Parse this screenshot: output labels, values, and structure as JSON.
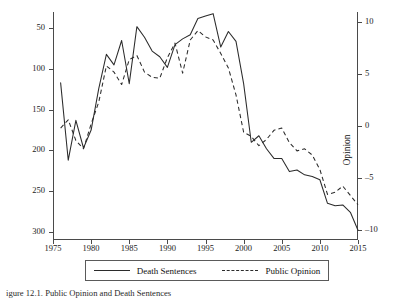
{
  "chart_data": {
    "type": "line",
    "title": "",
    "xlabel": "",
    "x": [
      1976,
      1977,
      1978,
      1979,
      1980,
      1981,
      1982,
      1983,
      1984,
      1985,
      1986,
      1987,
      1988,
      1989,
      1990,
      1991,
      1992,
      1993,
      1994,
      1995,
      1996,
      1997,
      1998,
      1999,
      2000,
      2001,
      2002,
      2003,
      2004,
      2005,
      2006,
      2007,
      2008,
      2009,
      2010,
      2011,
      2012,
      2013,
      2014,
      2015
    ],
    "xlim": [
      1975,
      2015
    ],
    "xticks": [
      1975,
      1980,
      1985,
      1990,
      1995,
      2000,
      2005,
      2010,
      2015
    ],
    "grid": false,
    "legend_position": "below-axis",
    "series": [
      {
        "name": "Death Sentences",
        "style": "solid",
        "axis": "left",
        "ylabel": "Death Sentences",
        "ylim": [
          40,
          320
        ],
        "yticks": [
          50,
          100,
          150,
          200,
          250,
          300
        ],
        "values": [
          233,
          138,
          187,
          153,
          175,
          226,
          268,
          255,
          285,
          232,
          302,
          289,
          272,
          265,
          252,
          280,
          287,
          292,
          312,
          315,
          318,
          277,
          296,
          284,
          232,
          160,
          168,
          152,
          140,
          140,
          124,
          126,
          120,
          118,
          114,
          85,
          82,
          83,
          74,
          52
        ]
      },
      {
        "name": "Public Opinion",
        "style": "dashed",
        "axis": "right",
        "ylabel": "Opinion",
        "ylim": [
          -11,
          11
        ],
        "yticks": [
          10,
          5,
          0,
          -5,
          -10
        ],
        "values": [
          -0.2,
          0.6,
          -1.4,
          -2.2,
          0.2,
          2.3,
          5.8,
          5.2,
          4.0,
          6.4,
          6.8,
          5.2,
          4.7,
          4.6,
          6.6,
          8.0,
          5.1,
          8.3,
          9.2,
          8.6,
          8.3,
          7.0,
          5.6,
          3.0,
          -0.6,
          -1.0,
          -1.9,
          -1.3,
          -0.4,
          -0.2,
          -1.6,
          -2.4,
          -2.2,
          -2.8,
          -4.2,
          -6.6,
          -6.4,
          -5.8,
          -6.7,
          -7.6
        ]
      }
    ],
    "axes": {
      "left": {
        "label": "Death Sentences",
        "ticks": [
          "300",
          "250",
          "200",
          "150",
          "100",
          "50"
        ]
      },
      "right": {
        "label": "Opinion",
        "ticks": [
          "10",
          "5",
          "0",
          "–5",
          "–10"
        ]
      },
      "bottom": {
        "ticks": [
          "1975",
          "1980",
          "1985",
          "1990",
          "1995",
          "2000",
          "2005",
          "2010",
          "2015"
        ]
      }
    }
  },
  "legend": {
    "entries": [
      {
        "label": "Death Sentences",
        "style": "solid"
      },
      {
        "label": "Public Opinion",
        "style": "dashed"
      }
    ]
  },
  "caption": {
    "text": "igure 12.1. Public Opinion and Death Sentences"
  }
}
